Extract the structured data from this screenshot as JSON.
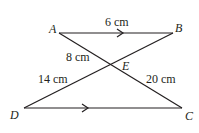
{
  "diagram": {
    "points": {
      "A": {
        "label": "A"
      },
      "B": {
        "label": "B"
      },
      "C": {
        "label": "C"
      },
      "D": {
        "label": "D"
      },
      "E": {
        "label": "E"
      }
    },
    "segments": [
      {
        "name": "AB",
        "label": "6 cm",
        "parallel_arrow": true
      },
      {
        "name": "DC",
        "label": "",
        "parallel_arrow": true
      },
      {
        "name": "AE",
        "label": "8 cm"
      },
      {
        "name": "DE",
        "label": "14 cm"
      },
      {
        "name": "EC",
        "label": "20 cm"
      }
    ],
    "labels": {
      "ab": "6 cm",
      "ae": "8 cm",
      "de": "14 cm",
      "ec": "20 cm"
    },
    "colors": {
      "line": "#231f20",
      "background": "#ffffff"
    }
  }
}
